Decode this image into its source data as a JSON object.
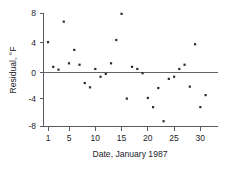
{
  "chart_data": {
    "type": "scatter",
    "title": "",
    "xlabel": "Date, January 1987",
    "ylabel": "Residual, °F",
    "xlim": [
      0,
      32
    ],
    "ylim": [
      -8,
      8
    ],
    "xticks": [
      1,
      5,
      10,
      15,
      20,
      25,
      30
    ],
    "xticklabels": [
      "1",
      "5",
      "10",
      "15",
      "20",
      "25",
      "30"
    ],
    "yticks": [
      -8,
      -4,
      0,
      4,
      8
    ],
    "yticklabels": [
      "-8",
      "-4",
      "0",
      "4",
      "8"
    ],
    "grid": false,
    "legend": null,
    "reference_lines": [
      {
        "orientation": "horizontal",
        "value": 0
      }
    ],
    "marker": {
      "shape": "square",
      "color": "#2b2b30",
      "size": 2.2
    },
    "series": [
      {
        "name": "Residual",
        "x": [
          1,
          2,
          3,
          4,
          5,
          6,
          7,
          8,
          9,
          10,
          11,
          12,
          13,
          14,
          15,
          16,
          17,
          18,
          19,
          20,
          21,
          22,
          23,
          24,
          25,
          26,
          27,
          28,
          29,
          30,
          31
        ],
        "values": [
          4.3,
          0.8,
          0.4,
          7.2,
          1.3,
          3.2,
          1.1,
          -1.5,
          -2.1,
          0.5,
          -0.6,
          -0.2,
          1.3,
          4.6,
          8.3,
          -3.7,
          0.8,
          0.5,
          -0.1,
          -3.6,
          -4.9,
          -2.2,
          -6.9,
          -0.9,
          -0.6,
          0.5,
          1.1,
          -2.0,
          4.0,
          -4.9,
          -3.2
        ]
      }
    ]
  },
  "axis": {
    "ylabel_degree": "°F",
    "ylabel_prefix": "Residual, "
  }
}
